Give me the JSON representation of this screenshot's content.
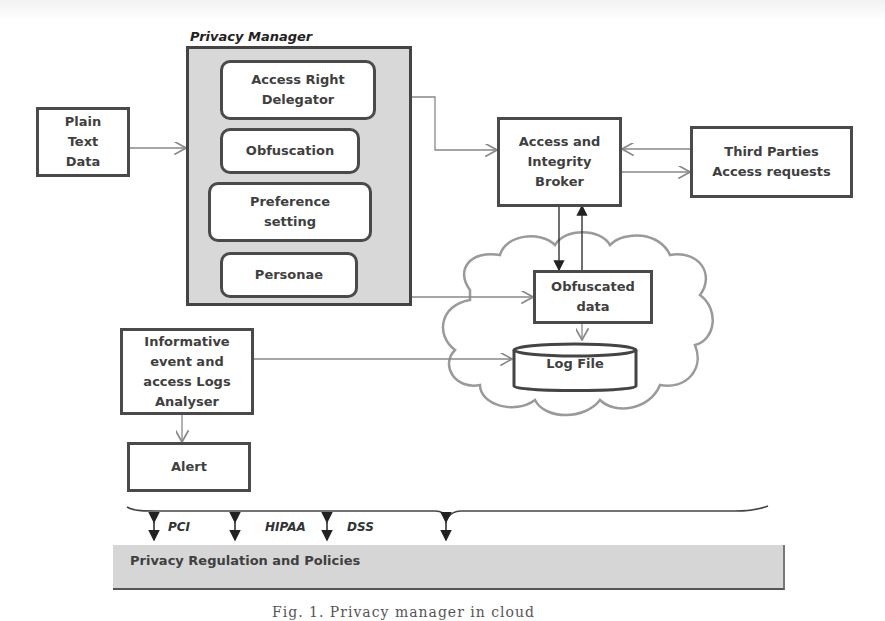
{
  "diagram": {
    "privacy_manager": {
      "title": "Privacy Manager",
      "components": [
        {
          "id": "access-right-delegator",
          "label_lines": [
            "Access Right",
            "Delegator"
          ]
        },
        {
          "id": "obfuscation",
          "label_lines": [
            "Obfuscation"
          ]
        },
        {
          "id": "preference-setting",
          "label_lines": [
            "Preference",
            "setting"
          ]
        },
        {
          "id": "personae",
          "label_lines": [
            "Personae"
          ]
        }
      ]
    },
    "plain_text_data": {
      "label_lines": [
        "Plain",
        "Text",
        "Data"
      ]
    },
    "access_integrity_broker": {
      "label_lines": [
        "Access and",
        "Integrity",
        "Broker"
      ]
    },
    "third_parties": {
      "label_lines": [
        "Third Parties",
        "Access requests"
      ]
    },
    "cloud": {
      "obfuscated_data": {
        "label_lines": [
          "Obfuscated",
          "data"
        ]
      },
      "log_file": {
        "label": "Log File"
      }
    },
    "analyser": {
      "label_lines": [
        "Informative",
        "event and",
        "access Logs",
        "Analyser"
      ]
    },
    "alert": {
      "label": "Alert"
    },
    "regulations": {
      "label": "Privacy Regulation and Policies",
      "tags": [
        "PCI",
        "HIPAA",
        "DSS"
      ]
    },
    "caption": "Fig. 1. Privacy manager in cloud"
  },
  "colors": {
    "box_border": "#4a4a4a",
    "frame_fill": "#d8d8d8",
    "wire": "#8a8a8a",
    "cloud": "#9a9a9a",
    "regulation_bar": "#d6d6d6"
  }
}
